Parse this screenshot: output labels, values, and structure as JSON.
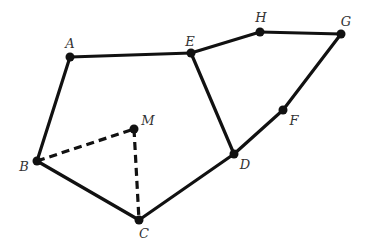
{
  "diagram": {
    "type": "geometric-graph",
    "colors": {
      "stroke": "#111111",
      "label": "#333333",
      "background": "#ffffff"
    },
    "points": [
      {
        "id": "A",
        "label": "A",
        "x": 70,
        "y": 57,
        "lx": 70,
        "ly": 48
      },
      {
        "id": "E",
        "label": "E",
        "x": 191,
        "y": 53,
        "lx": 190,
        "ly": 46
      },
      {
        "id": "H",
        "label": "H",
        "x": 260,
        "y": 32,
        "lx": 261,
        "ly": 22
      },
      {
        "id": "G",
        "label": "G",
        "x": 341,
        "y": 34,
        "lx": 346,
        "ly": 26
      },
      {
        "id": "F",
        "label": "F",
        "x": 283,
        "y": 110,
        "lx": 294,
        "ly": 125
      },
      {
        "id": "D",
        "label": "D",
        "x": 234,
        "y": 154,
        "lx": 245,
        "ly": 169
      },
      {
        "id": "C",
        "label": "C",
        "x": 139,
        "y": 220,
        "lx": 144,
        "ly": 238
      },
      {
        "id": "B",
        "label": "B",
        "x": 37,
        "y": 161,
        "lx": 24,
        "ly": 171
      },
      {
        "id": "M",
        "label": "M",
        "x": 134,
        "y": 129,
        "lx": 148,
        "ly": 125
      }
    ],
    "solid_edges": [
      [
        "A",
        "E"
      ],
      [
        "E",
        "H"
      ],
      [
        "H",
        "G"
      ],
      [
        "G",
        "F"
      ],
      [
        "F",
        "D"
      ],
      [
        "E",
        "D"
      ],
      [
        "D",
        "C"
      ],
      [
        "C",
        "B"
      ],
      [
        "B",
        "A"
      ]
    ],
    "dashed_edges": [
      [
        "B",
        "M"
      ],
      [
        "M",
        "C"
      ]
    ]
  }
}
